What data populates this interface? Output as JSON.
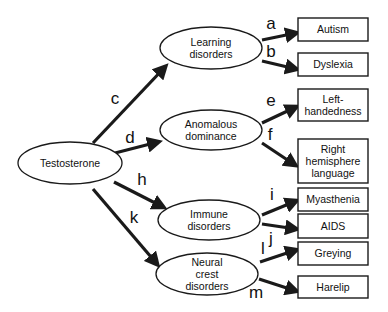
{
  "diagram": {
    "source": {
      "id": "testosterone",
      "label": "Testosterone",
      "cx": 70,
      "cy": 163,
      "rx": 52,
      "ry": 21
    },
    "intermediates": [
      {
        "id": "learning",
        "lines": [
          "Learning",
          "disorders"
        ],
        "cx": 211,
        "cy": 48,
        "rx": 51,
        "ry": 21
      },
      {
        "id": "anomalous",
        "lines": [
          "Anomalous",
          "dominance"
        ],
        "cx": 211,
        "cy": 130,
        "rx": 51,
        "ry": 20
      },
      {
        "id": "immune",
        "lines": [
          "Immune",
          "disorders"
        ],
        "cx": 209,
        "cy": 220,
        "rx": 51,
        "ry": 20
      },
      {
        "id": "neural",
        "lines": [
          "Neural",
          "crest",
          "disorders"
        ],
        "cx": 207,
        "cy": 274,
        "rx": 51,
        "ry": 21
      }
    ],
    "outcomes": [
      {
        "id": "autism",
        "lines": [
          "Autism"
        ],
        "x": 298,
        "y": 18,
        "w": 70,
        "h": 23
      },
      {
        "id": "dyslexia",
        "lines": [
          "Dyslexia"
        ],
        "x": 298,
        "y": 53,
        "w": 70,
        "h": 23
      },
      {
        "id": "left-handedness",
        "lines": [
          "Left-",
          "handedness"
        ],
        "x": 298,
        "y": 89,
        "w": 70,
        "h": 32
      },
      {
        "id": "right-hemisphere",
        "lines": [
          "Right",
          "hemisphere",
          "language"
        ],
        "x": 298,
        "y": 139,
        "w": 70,
        "h": 44
      },
      {
        "id": "myasthenia",
        "lines": [
          "Myasthenia"
        ],
        "x": 298,
        "y": 188,
        "w": 70,
        "h": 23
      },
      {
        "id": "aids",
        "lines": [
          "AIDS"
        ],
        "x": 298,
        "y": 214,
        "w": 70,
        "h": 24
      },
      {
        "id": "greying",
        "lines": [
          "Greying"
        ],
        "x": 298,
        "y": 242,
        "w": 70,
        "h": 23
      },
      {
        "id": "harelip",
        "lines": [
          "Harelip"
        ],
        "x": 298,
        "y": 276,
        "w": 70,
        "h": 22
      }
    ],
    "edges": [
      {
        "label": "c",
        "from": "testosterone",
        "to": "learning",
        "x1": 93,
        "y1": 143,
        "x2": 165,
        "y2": 67,
        "lx": 115,
        "ly": 104
      },
      {
        "label": "d",
        "from": "testosterone",
        "to": "anomalous",
        "x1": 115,
        "y1": 153,
        "x2": 158,
        "y2": 142,
        "lx": 130,
        "ly": 143
      },
      {
        "label": "h",
        "from": "testosterone",
        "to": "immune",
        "x1": 114,
        "y1": 182,
        "x2": 163,
        "y2": 207,
        "lx": 142,
        "ly": 185
      },
      {
        "label": "k",
        "from": "testosterone",
        "to": "neural",
        "x1": 93,
        "y1": 189,
        "x2": 157,
        "y2": 264,
        "lx": 134,
        "ly": 223
      },
      {
        "label": "a",
        "from": "learning",
        "to": "autism",
        "x1": 262,
        "y1": 40,
        "x2": 296,
        "y2": 33,
        "lx": 271,
        "ly": 29
      },
      {
        "label": "b",
        "from": "learning",
        "to": "dyslexia",
        "x1": 262,
        "y1": 61,
        "x2": 296,
        "y2": 69,
        "lx": 271,
        "ly": 57
      },
      {
        "label": "e",
        "from": "anomalous",
        "to": "left-handedness",
        "x1": 262,
        "y1": 123,
        "x2": 296,
        "y2": 107,
        "lx": 271,
        "ly": 106
      },
      {
        "label": "f",
        "from": "anomalous",
        "to": "right-hemisphere",
        "x1": 262,
        "y1": 143,
        "x2": 295,
        "y2": 165,
        "lx": 270,
        "ly": 140
      },
      {
        "label": "i",
        "from": "immune",
        "to": "myasthenia",
        "x1": 262,
        "y1": 215,
        "x2": 296,
        "y2": 201,
        "lx": 272,
        "ly": 200
      },
      {
        "label": "j",
        "from": "immune",
        "to": "aids",
        "x1": 262,
        "y1": 224,
        "x2": 296,
        "y2": 229,
        "lx": 271,
        "ly": 244
      },
      {
        "label": "l",
        "from": "neural",
        "to": "greying",
        "x1": 260,
        "y1": 262,
        "x2": 296,
        "y2": 250,
        "lx": 263,
        "ly": 254
      },
      {
        "label": "m",
        "from": "neural",
        "to": "harelip",
        "x1": 259,
        "y1": 279,
        "x2": 296,
        "y2": 291,
        "lx": 256,
        "ly": 298
      }
    ],
    "colors": {
      "stroke": "#1a1a1a",
      "background": "#ffffff"
    }
  }
}
